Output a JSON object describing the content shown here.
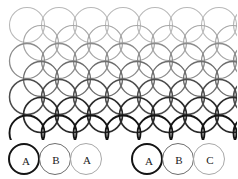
{
  "figure": {
    "type": "circle-packing-stacking-diagram",
    "width": 237,
    "height": 140,
    "circle_radius": 17.5,
    "row_vertical_spacing": 18,
    "row_horizontal_offset": 14,
    "first_row_center_x": 27,
    "first_row_center_y": 25,
    "columns_per_row": 8,
    "rows": [
      {
        "index": 0,
        "offset": 0,
        "color": "#b9b9b9",
        "stroke_width": 1.1,
        "count": 8
      },
      {
        "index": 1,
        "offset": 1,
        "color": "#a6a6a6",
        "stroke_width": 1.2,
        "count": 8
      },
      {
        "index": 2,
        "offset": 0,
        "color": "#8c8c8c",
        "stroke_width": 1.3,
        "count": 8
      },
      {
        "index": 3,
        "offset": 1,
        "color": "#6e6e6e",
        "stroke_width": 1.4,
        "count": 8
      },
      {
        "index": 4,
        "offset": 0,
        "color": "#4d4d4d",
        "stroke_width": 1.5,
        "count": 8
      },
      {
        "index": 5,
        "offset": 1,
        "color": "#2b2b2b",
        "stroke_width": 1.7,
        "count": 8
      },
      {
        "index": 6,
        "offset": 0,
        "color": "#141414",
        "stroke_width": 1.9,
        "count": 8
      }
    ],
    "colors": {
      "lightest": "#b9b9b9",
      "mid": "#6e6e6e",
      "darkest": "#141414",
      "background": "#ffffff"
    }
  },
  "legend": {
    "groups": [
      {
        "id": "hcp",
        "sequence": "ABA",
        "items": [
          {
            "label": "A",
            "color": "#141414",
            "stroke_width": 2.0
          },
          {
            "label": "B",
            "color": "#6e6e6e",
            "stroke_width": 1.3
          },
          {
            "label": "A",
            "color": "#a8a8a8",
            "stroke_width": 1.1
          }
        ]
      },
      {
        "id": "fcc",
        "sequence": "ABC",
        "items": [
          {
            "label": "A",
            "color": "#141414",
            "stroke_width": 2.0
          },
          {
            "label": "B",
            "color": "#6e6e6e",
            "stroke_width": 1.3
          },
          {
            "label": "C",
            "color": "#a8a8a8",
            "stroke_width": 1.1
          }
        ]
      }
    ]
  }
}
